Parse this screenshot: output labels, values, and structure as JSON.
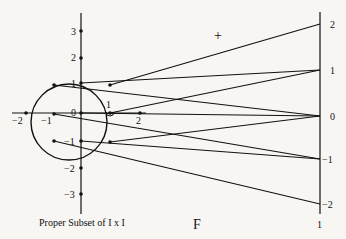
{
  "diagram": {
    "left_caption": "Proper Subset of I x I",
    "map_label": "F",
    "plus_label": "+",
    "right_axis_label": "1",
    "vertical_axis_labels": [
      "3",
      "2",
      "1",
      "0",
      "−1",
      "−2",
      "−3"
    ],
    "horizontal_axis_labels": [
      "−2",
      "−1",
      "1",
      "2"
    ],
    "right_axis_ticks": [
      "2",
      "1",
      "0",
      "−1",
      "−2"
    ]
  }
}
